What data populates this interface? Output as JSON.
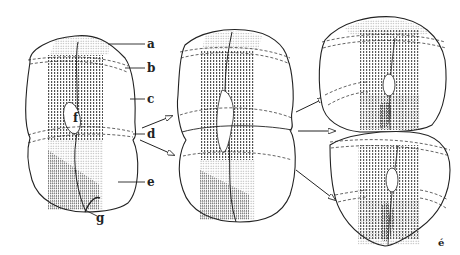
{
  "figure": {
    "labels": {
      "a": "a",
      "b": "b",
      "c": "c",
      "d": "d",
      "e": "e",
      "f": "f",
      "g": "g"
    },
    "corner_mark": "é",
    "stages": [
      {
        "name": "parent-cell"
      },
      {
        "name": "dividing-cell"
      },
      {
        "name": "daughter-cells",
        "count": 2
      }
    ],
    "colors": {
      "ink": "#222222",
      "background": "#ffffff",
      "stipple": "#555555"
    }
  }
}
